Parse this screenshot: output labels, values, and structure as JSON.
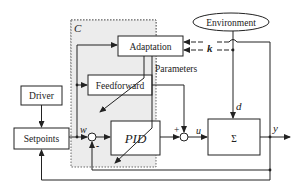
{
  "diagram": {
    "controller_label": "C",
    "blocks": {
      "environment": "Environment",
      "adaptation": "Adaptation",
      "feedforward": "Feedforward",
      "driver": "Driver",
      "setpoints": "Setpoints",
      "pid": "PID",
      "plant": "Σ"
    },
    "labels": {
      "parameters": "Parameters",
      "k": "k",
      "d": "d",
      "w": "w",
      "u": "u",
      "y": "y",
      "plus": "+",
      "minus": "-"
    },
    "colors": {
      "controller_region": "#ececec",
      "stroke": "#222222"
    }
  }
}
